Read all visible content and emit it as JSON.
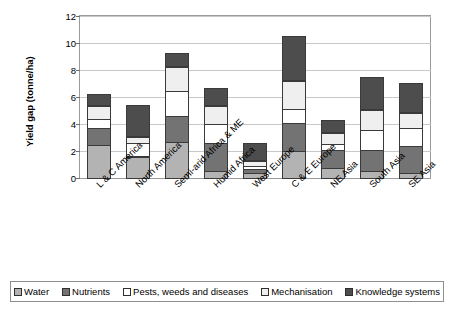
{
  "chart_data": {
    "type": "bar",
    "subtype": "stacked-bar",
    "title": "",
    "xlabel": "",
    "ylabel": "Yield gap (tonne/ha)",
    "ylim": [
      0,
      12
    ],
    "yticks": [
      0,
      2,
      4,
      6,
      8,
      10,
      12
    ],
    "grid": true,
    "legend_position": "bottom",
    "categories": [
      "L & C America",
      "North America",
      "Semi-arid Africa & ME",
      "Humid Africa",
      "West Europe",
      "C & E Europe",
      "NE Asia",
      "South Asia",
      "SE Asia"
    ],
    "series": [
      {
        "name": "Water",
        "color": "#b3b3b3",
        "values": [
          2.55,
          1.6,
          2.75,
          0.6,
          0.45,
          2.05,
          0.8,
          0.6,
          0.45
        ]
      },
      {
        "name": "Nutrients",
        "color": "#737373",
        "values": [
          1.3,
          0.2,
          2.0,
          2.15,
          0.35,
          2.2,
          1.45,
          1.65,
          2.05
        ]
      },
      {
        "name": "Pests, weeds and diseases",
        "color": "#ffffff",
        "values": [
          0.75,
          1.05,
          1.9,
          1.45,
          0.3,
          1.1,
          0.5,
          1.55,
          1.4
        ]
      },
      {
        "name": "Mechanisation",
        "color": "#efefef",
        "values": [
          1.0,
          0.5,
          1.85,
          1.45,
          0.45,
          2.15,
          0.85,
          1.5,
          1.25
        ]
      },
      {
        "name": "Knowledge systems",
        "color": "#4d4d4d",
        "values": [
          0.9,
          2.35,
          1.05,
          1.35,
          1.35,
          3.3,
          1.0,
          2.45,
          2.15
        ]
      }
    ],
    "totals": [
      6.5,
      5.7,
      9.55,
      7.0,
      2.9,
      10.8,
      4.6,
      7.75,
      7.3
    ]
  },
  "axis": {
    "y_title": "Yield gap (tonne/ha)",
    "y_tick_labels": [
      "12",
      "10",
      "8",
      "6",
      "4",
      "2",
      "0"
    ]
  },
  "legend": {
    "items": [
      {
        "label": "Water",
        "color": "#b3b3b3"
      },
      {
        "label": "Nutrients",
        "color": "#737373"
      },
      {
        "label": "Pests, weeds and diseases",
        "color": "#ffffff"
      },
      {
        "label": "Mechanisation",
        "color": "#efefef"
      },
      {
        "label": "Knowledge systems",
        "color": "#4d4d4d"
      }
    ]
  }
}
